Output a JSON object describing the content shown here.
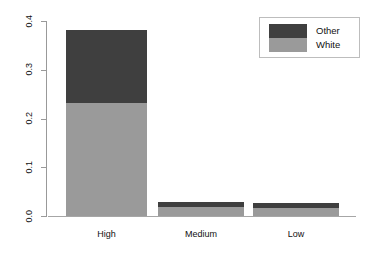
{
  "chart_data": {
    "type": "bar",
    "subtype": "stacked",
    "title": "",
    "xlabel": "",
    "ylabel": "",
    "categories": [
      "High",
      "Medium",
      "Low"
    ],
    "series": [
      {
        "name": "White",
        "color": "#9a9a9a",
        "values": [
          0.232,
          0.018,
          0.016
        ]
      },
      {
        "name": "Other",
        "color": "#3f3f3f",
        "values": [
          0.149,
          0.011,
          0.011
        ]
      }
    ],
    "totals": [
      0.381,
      0.029,
      0.027
    ],
    "ylim": [
      0.0,
      0.4
    ],
    "yticks": [
      0.0,
      0.1,
      0.2,
      0.3,
      0.4
    ],
    "ytick_labels": [
      "0.0",
      "0.1",
      "0.2",
      "0.3",
      "0.4"
    ],
    "grid": false,
    "legend": {
      "position": "top-right",
      "entries": [
        {
          "label": "Other",
          "color": "#3f3f3f"
        },
        {
          "label": "White",
          "color": "#9a9a9a"
        }
      ]
    },
    "axis_color": "#999999"
  }
}
